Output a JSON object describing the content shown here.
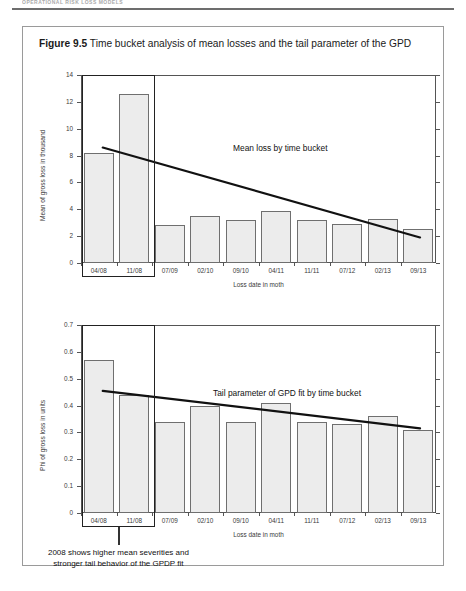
{
  "page": {
    "running_head": "OPERATIONAL RISK LOSS MODELS",
    "background": "#ffffff"
  },
  "figure": {
    "number": "Figure 9.5",
    "caption": "Time bucket analysis of mean losses and the tail parameter of the GPD",
    "border_color": "#9a9a9a"
  },
  "callout": {
    "line1": "2008 shows higher mean severities and",
    "line2": "stronger tail behavior of the GPDP fit"
  },
  "chart_data": [
    {
      "type": "bar",
      "id": "mean-loss-chart",
      "title": "",
      "categories": [
        "04/08",
        "11/08",
        "07/09",
        "02/10",
        "09/10",
        "04/11",
        "11/11",
        "07/12",
        "02/13",
        "09/13"
      ],
      "values": [
        8.2,
        12.6,
        2.8,
        3.5,
        3.2,
        3.9,
        3.2,
        2.9,
        3.3,
        2.5
      ],
      "xlabel": "Loss date in moth",
      "ylabel": "Mean of gross loss in thousand",
      "ylim": [
        0,
        14
      ],
      "yticks": [
        "0",
        "2",
        "4",
        "6",
        "8",
        "10",
        "12",
        "14"
      ],
      "ytick_values": [
        0,
        2,
        4,
        6,
        8,
        10,
        12,
        14
      ],
      "grid": false,
      "bar_fill": "#ececec",
      "bar_stroke": "#6f6f6f",
      "series": [
        {
          "name": "Mean loss by time bucket",
          "type": "line",
          "annotation": "Mean loss by time bucket",
          "start_value": 8.6,
          "end_value": 1.9
        }
      ]
    },
    {
      "type": "bar",
      "id": "tail-parameter-chart",
      "title": "",
      "categories": [
        "04/08",
        "11/08",
        "07/09",
        "02/10",
        "09/10",
        "04/11",
        "11/11",
        "07/12",
        "02/13",
        "09/13"
      ],
      "values": [
        0.57,
        0.44,
        0.34,
        0.4,
        0.34,
        0.41,
        0.34,
        0.33,
        0.36,
        0.31
      ],
      "xlabel": "Loss date in moth",
      "ylabel": "Phi of gross loss in units",
      "ylim": [
        0,
        0.7
      ],
      "yticks": [
        "0",
        "0.1",
        "0.2",
        "0.3",
        "0.4",
        "0.5",
        "0.6",
        "0.7"
      ],
      "ytick_values": [
        0,
        0.1,
        0.2,
        0.3,
        0.4,
        0.5,
        0.6,
        0.7
      ],
      "grid": false,
      "bar_fill": "#ececec",
      "bar_stroke": "#6f6f6f",
      "series": [
        {
          "name": "Tail parameter of GPD fit by time bucket",
          "type": "line",
          "annotation": "Tail parameter of GPD fit by time bucket",
          "start_value": 0.455,
          "end_value": 0.315
        }
      ]
    }
  ]
}
